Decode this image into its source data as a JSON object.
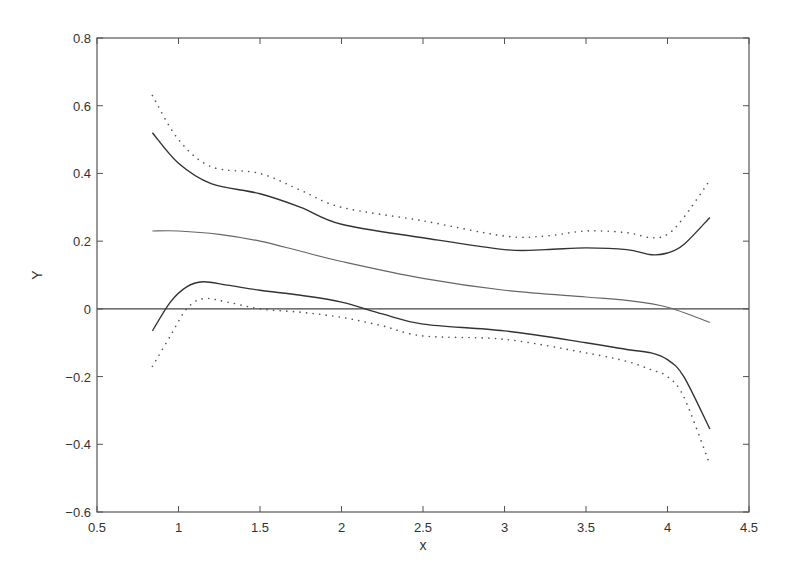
{
  "chart_data": {
    "type": "line",
    "title": "",
    "xlabel": "x",
    "ylabel": "Y",
    "xlim": [
      0.5,
      4.5
    ],
    "ylim": [
      -0.6,
      0.8
    ],
    "xticks": [
      0.5,
      1,
      1.5,
      2,
      2.5,
      3,
      3.5,
      4,
      4.5
    ],
    "xtick_labels": [
      "0.5",
      "1",
      "1.5",
      "2",
      "2.5",
      "3",
      "3.5",
      "4",
      "4.5"
    ],
    "yticks": [
      -0.6,
      -0.4,
      -0.2,
      0,
      0.2,
      0.4,
      0.6,
      0.8
    ],
    "ytick_labels": [
      "-0.6",
      "-0.4",
      "-0.2",
      "0",
      "0.2",
      "0.4",
      "0.6",
      "0.8"
    ],
    "grid": false,
    "legend": null,
    "reference_line": {
      "y": 0,
      "style": "solid"
    },
    "series": [
      {
        "name": "upper-band-solid",
        "style": "solid",
        "color": "#333333",
        "x": [
          0.84,
          1.0,
          1.2,
          1.5,
          1.75,
          2.0,
          2.5,
          3.0,
          3.25,
          3.5,
          3.75,
          3.9,
          4.0,
          4.1,
          4.26
        ],
        "y": [
          0.52,
          0.43,
          0.37,
          0.34,
          0.3,
          0.25,
          0.21,
          0.175,
          0.175,
          0.18,
          0.175,
          0.16,
          0.165,
          0.19,
          0.27
        ]
      },
      {
        "name": "upper-band-dotted",
        "style": "dotted",
        "color": "#555555",
        "x": [
          0.84,
          1.0,
          1.2,
          1.5,
          1.75,
          2.0,
          2.5,
          3.0,
          3.25,
          3.5,
          3.75,
          3.9,
          4.0,
          4.1,
          4.26
        ],
        "y": [
          0.63,
          0.5,
          0.42,
          0.4,
          0.35,
          0.3,
          0.26,
          0.215,
          0.215,
          0.23,
          0.225,
          0.21,
          0.22,
          0.27,
          0.38
        ]
      },
      {
        "name": "estimate",
        "style": "solid-thin",
        "color": "#666666",
        "x": [
          0.84,
          1.0,
          1.25,
          1.5,
          1.75,
          2.0,
          2.5,
          3.0,
          3.5,
          3.75,
          4.0,
          4.26
        ],
        "y": [
          0.23,
          0.23,
          0.22,
          0.2,
          0.17,
          0.14,
          0.09,
          0.055,
          0.035,
          0.025,
          0.005,
          -0.04
        ]
      },
      {
        "name": "lower-band-solid",
        "style": "solid",
        "color": "#333333",
        "x": [
          0.84,
          0.95,
          1.05,
          1.15,
          1.3,
          1.5,
          1.75,
          2.0,
          2.25,
          2.5,
          3.0,
          3.5,
          3.75,
          3.9,
          4.0,
          4.1,
          4.26
        ],
        "y": [
          -0.065,
          0.02,
          0.065,
          0.08,
          0.07,
          0.055,
          0.04,
          0.02,
          -0.015,
          -0.045,
          -0.065,
          -0.1,
          -0.12,
          -0.13,
          -0.15,
          -0.2,
          -0.355
        ]
      },
      {
        "name": "lower-band-dotted",
        "style": "dotted",
        "color": "#555555",
        "x": [
          0.84,
          0.95,
          1.05,
          1.15,
          1.3,
          1.5,
          1.75,
          2.0,
          2.25,
          2.5,
          3.0,
          3.5,
          3.75,
          3.9,
          4.0,
          4.1,
          4.26
        ],
        "y": [
          -0.17,
          -0.08,
          0.0,
          0.03,
          0.02,
          0.0,
          -0.01,
          -0.025,
          -0.05,
          -0.08,
          -0.09,
          -0.13,
          -0.155,
          -0.18,
          -0.2,
          -0.26,
          -0.46
        ]
      }
    ]
  }
}
